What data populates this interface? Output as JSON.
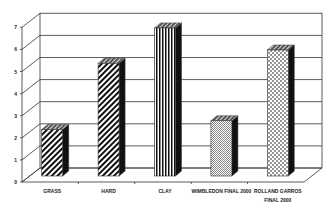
{
  "chart_data": {
    "type": "bar",
    "style": "3d-column",
    "title": "",
    "xlabel": "",
    "ylabel": "",
    "categories": [
      "GRASS",
      "HARD",
      "CLAY",
      "WIMBLEDON FINAL 2000",
      "ROLLAND GARROS FINAL 2000"
    ],
    "category_label_lines": [
      [
        "GRASS"
      ],
      [
        "HARD"
      ],
      [
        "CLAY"
      ],
      [
        "WIMBLEDON FINAL 2000"
      ],
      [
        "ROLLAND GARROS",
        "FINAL 2000"
      ]
    ],
    "values": [
      2.1,
      5.1,
      6.7,
      2.5,
      5.7
    ],
    "patterns": [
      "diagonal-hatch",
      "diagonal-hatch",
      "vertical-stripes",
      "fine-checker",
      "dots"
    ],
    "ylim": [
      0,
      7
    ],
    "yticks": [
      0,
      1,
      2,
      3,
      4,
      5,
      6,
      7
    ],
    "grid": true,
    "legend": null
  },
  "colors": {
    "line": "#333333",
    "bar_fill": "#ffffff",
    "pattern": "#111111",
    "side": "#111111"
  }
}
